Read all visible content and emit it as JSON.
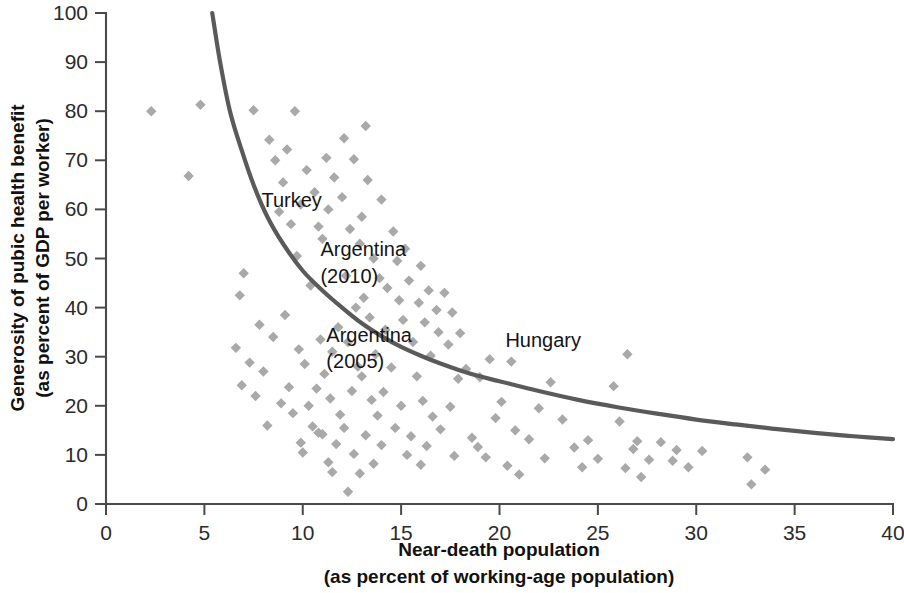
{
  "chart_data": {
    "type": "scatter",
    "title": "",
    "xlabel": "Near-death population",
    "xlabel_sub": "(as percent of working-age population)",
    "ylabel": "Generosity of pubic health benefit",
    "ylabel_sub": "(as percent of GDP per worker)",
    "xlim": [
      0,
      40
    ],
    "ylim": [
      0,
      100
    ],
    "xticks": [
      0,
      5,
      10,
      15,
      20,
      25,
      30,
      35,
      40
    ],
    "yticks": [
      0,
      10,
      20,
      30,
      40,
      50,
      60,
      70,
      80,
      90,
      100
    ],
    "grid": false,
    "legend": "none",
    "marker_shape": "diamond",
    "marker_color": "#a9a9a9",
    "curve_color": "#5a5a5a",
    "axis_color": "#4a4a4a",
    "annotations": [
      {
        "label": "Turkey",
        "x": 7.9,
        "y": 60.5
      },
      {
        "label": "Argentina",
        "x": 10.9,
        "y": 50.5
      },
      {
        "label": "(2010)",
        "x": 10.9,
        "y": 45.0
      },
      {
        "label": "Argentina",
        "x": 11.2,
        "y": 33.0
      },
      {
        "label": "(2005)",
        "x": 11.2,
        "y": 27.8
      },
      {
        "label": "Hungary",
        "x": 20.3,
        "y": 32.0
      }
    ],
    "curve": {
      "description": "Downward-sloping convex trend line fitted through the scatter",
      "points": [
        [
          5.4,
          100.0
        ],
        [
          5.8,
          90.0
        ],
        [
          6.3,
          80.0
        ],
        [
          6.9,
          72.0
        ],
        [
          7.5,
          65.0
        ],
        [
          8.2,
          58.5
        ],
        [
          9.0,
          53.0
        ],
        [
          10.0,
          47.5
        ],
        [
          11.0,
          43.5
        ],
        [
          12.0,
          40.0
        ],
        [
          13.0,
          36.8
        ],
        [
          14.0,
          34.2
        ],
        [
          15.0,
          32.0
        ],
        [
          16.0,
          30.2
        ],
        [
          17.0,
          28.6
        ],
        [
          18.0,
          27.2
        ],
        [
          19.0,
          26.0
        ],
        [
          20.0,
          25.0
        ],
        [
          22.0,
          23.0
        ],
        [
          24.0,
          21.2
        ],
        [
          26.0,
          19.7
        ],
        [
          28.0,
          18.4
        ],
        [
          30.0,
          17.2
        ],
        [
          32.0,
          16.2
        ],
        [
          34.0,
          15.3
        ],
        [
          36.0,
          14.5
        ],
        [
          38.0,
          13.8
        ],
        [
          40.0,
          13.2
        ]
      ]
    },
    "points": [
      [
        2.3,
        80.0
      ],
      [
        4.8,
        81.3
      ],
      [
        4.2,
        66.8
      ],
      [
        7.5,
        80.2
      ],
      [
        9.6,
        80.0
      ],
      [
        13.2,
        77.0
      ],
      [
        12.1,
        74.5
      ],
      [
        8.3,
        74.2
      ],
      [
        9.2,
        72.2
      ],
      [
        11.2,
        70.5
      ],
      [
        12.6,
        70.2
      ],
      [
        8.6,
        70.0
      ],
      [
        10.2,
        68.0
      ],
      [
        11.6,
        66.5
      ],
      [
        13.3,
        66.0
      ],
      [
        9.0,
        65.5
      ],
      [
        10.6,
        63.5
      ],
      [
        12.0,
        62.5
      ],
      [
        14.0,
        62.0
      ],
      [
        9.9,
        61.0
      ],
      [
        11.3,
        60.0
      ],
      [
        8.8,
        59.5
      ],
      [
        13.0,
        58.5
      ],
      [
        9.4,
        57.0
      ],
      [
        10.8,
        56.5
      ],
      [
        12.4,
        56.0
      ],
      [
        14.6,
        55.5
      ],
      [
        11.0,
        54.0
      ],
      [
        12.9,
        53.0
      ],
      [
        15.2,
        52.0
      ],
      [
        9.7,
        50.5
      ],
      [
        13.6,
        50.0
      ],
      [
        14.8,
        49.5
      ],
      [
        16.0,
        48.5
      ],
      [
        7.0,
        47.0
      ],
      [
        12.2,
        46.5
      ],
      [
        13.9,
        46.0
      ],
      [
        15.4,
        45.5
      ],
      [
        10.4,
        44.5
      ],
      [
        14.3,
        44.0
      ],
      [
        16.4,
        43.5
      ],
      [
        17.2,
        43.0
      ],
      [
        6.8,
        42.5
      ],
      [
        13.1,
        42.0
      ],
      [
        14.9,
        41.5
      ],
      [
        15.9,
        41.0
      ],
      [
        12.7,
        40.0
      ],
      [
        16.8,
        39.5
      ],
      [
        17.6,
        39.0
      ],
      [
        9.1,
        38.5
      ],
      [
        13.4,
        38.0
      ],
      [
        15.1,
        37.5
      ],
      [
        16.2,
        37.0
      ],
      [
        7.8,
        36.5
      ],
      [
        11.8,
        36.0
      ],
      [
        14.2,
        35.5
      ],
      [
        16.9,
        35.0
      ],
      [
        18.0,
        34.8
      ],
      [
        8.5,
        34.0
      ],
      [
        10.9,
        33.5
      ],
      [
        12.3,
        33.0
      ],
      [
        15.6,
        33.0
      ],
      [
        17.4,
        32.5
      ],
      [
        6.6,
        31.8
      ],
      [
        9.8,
        31.5
      ],
      [
        11.5,
        31.0
      ],
      [
        13.7,
        30.5
      ],
      [
        16.5,
        30.2
      ],
      [
        26.5,
        30.5
      ],
      [
        19.5,
        29.5
      ],
      [
        20.6,
        29.0
      ],
      [
        7.3,
        28.8
      ],
      [
        10.1,
        28.5
      ],
      [
        12.8,
        28.0
      ],
      [
        14.5,
        27.8
      ],
      [
        18.3,
        27.5
      ],
      [
        8.0,
        27.0
      ],
      [
        11.1,
        26.5
      ],
      [
        13.0,
        26.0
      ],
      [
        15.8,
        26.0
      ],
      [
        19.0,
        25.8
      ],
      [
        17.9,
        25.5
      ],
      [
        22.6,
        24.8
      ],
      [
        25.8,
        24.0
      ],
      [
        6.9,
        24.2
      ],
      [
        9.3,
        23.8
      ],
      [
        10.7,
        23.5
      ],
      [
        12.5,
        23.0
      ],
      [
        14.1,
        22.8
      ],
      [
        7.6,
        22.0
      ],
      [
        11.4,
        21.5
      ],
      [
        13.5,
        21.2
      ],
      [
        16.1,
        21.0
      ],
      [
        20.1,
        20.8
      ],
      [
        8.9,
        20.5
      ],
      [
        10.3,
        20.0
      ],
      [
        15.0,
        20.0
      ],
      [
        17.5,
        19.8
      ],
      [
        22.0,
        19.5
      ],
      [
        9.5,
        18.5
      ],
      [
        11.9,
        18.2
      ],
      [
        13.8,
        18.0
      ],
      [
        16.6,
        17.8
      ],
      [
        19.8,
        17.5
      ],
      [
        23.2,
        17.2
      ],
      [
        26.1,
        16.8
      ],
      [
        8.2,
        16.0
      ],
      [
        10.5,
        15.8
      ],
      [
        12.1,
        15.5
      ],
      [
        14.7,
        15.5
      ],
      [
        17.0,
        15.2
      ],
      [
        20.8,
        15.0
      ],
      [
        10.8,
        14.5
      ],
      [
        11.0,
        14.2
      ],
      [
        13.2,
        14.0
      ],
      [
        15.5,
        13.8
      ],
      [
        18.6,
        13.5
      ],
      [
        21.5,
        13.2
      ],
      [
        24.5,
        13.0
      ],
      [
        27.0,
        12.8
      ],
      [
        28.2,
        12.6
      ],
      [
        9.9,
        12.5
      ],
      [
        11.7,
        12.2
      ],
      [
        14.0,
        12.0
      ],
      [
        16.3,
        11.8
      ],
      [
        18.9,
        11.6
      ],
      [
        23.8,
        11.5
      ],
      [
        26.8,
        11.2
      ],
      [
        29.0,
        11.0
      ],
      [
        30.3,
        10.8
      ],
      [
        10.0,
        10.5
      ],
      [
        12.6,
        10.2
      ],
      [
        15.3,
        10.0
      ],
      [
        17.7,
        9.8
      ],
      [
        19.3,
        9.5
      ],
      [
        22.3,
        9.3
      ],
      [
        25.0,
        9.2
      ],
      [
        27.6,
        9.0
      ],
      [
        28.8,
        8.8
      ],
      [
        32.6,
        9.5
      ],
      [
        11.3,
        8.5
      ],
      [
        13.6,
        8.2
      ],
      [
        16.0,
        8.0
      ],
      [
        20.4,
        7.8
      ],
      [
        24.2,
        7.5
      ],
      [
        26.4,
        7.3
      ],
      [
        29.6,
        7.5
      ],
      [
        33.5,
        7.0
      ],
      [
        11.5,
        6.5
      ],
      [
        12.9,
        6.2
      ],
      [
        21.0,
        6.0
      ],
      [
        27.2,
        5.5
      ],
      [
        32.8,
        4.0
      ],
      [
        12.3,
        2.5
      ]
    ]
  }
}
